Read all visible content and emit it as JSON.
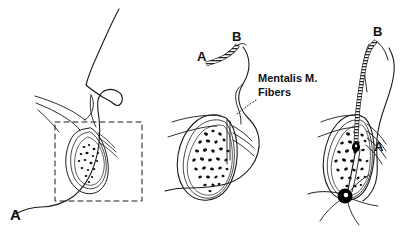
{
  "figure": {
    "background_color": "#ffffff",
    "line_color": "#1a1a1a",
    "panel_count": 3
  },
  "panels": [
    {
      "id": "panel-a",
      "label": "A",
      "caption": "Lateral facial profile with mandibular symphysis region outlined",
      "marks": []
    },
    {
      "id": "panel-b",
      "label": "",
      "caption": "Sagittal section of chin showing implant strip and mentalis muscle fibers",
      "marks": [
        "A",
        "B"
      ]
    },
    {
      "id": "panel-c",
      "label": "",
      "caption": "Implant strip rotated into vertical position and secured",
      "marks": [
        "A",
        "B"
      ]
    }
  ],
  "labels": {
    "panel_a_letter": "A",
    "implant_end_a_mid": "A",
    "implant_end_b_mid": "B",
    "implant_end_a_right": "A",
    "implant_end_b_right": "B",
    "annotation_line1": "Mentalis M.",
    "annotation_line2": "Fibers"
  },
  "colors": {
    "stroke": "#1a1a1a",
    "fill_bone_marrow": "#000000",
    "fill_background": "#ffffff",
    "knot": "#000000"
  }
}
